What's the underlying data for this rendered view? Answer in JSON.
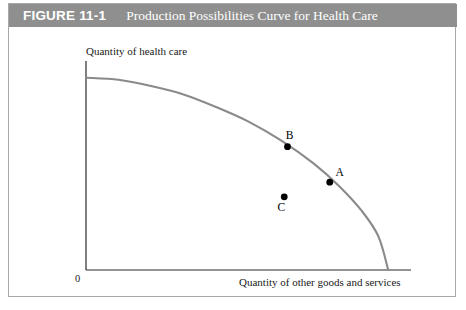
{
  "figure": {
    "number": "FIGURE 11-1",
    "title": "Production Possibilities Curve for Health Care"
  },
  "colors": {
    "header_background": "#8f8f8f",
    "header_text": "#ffffff",
    "border": "#a8a8a8",
    "curve": "#8a8a8a",
    "axis": "#2b2b2b",
    "point": "#000000",
    "plot_background": "#ffffff"
  },
  "chart_data": {
    "type": "line",
    "title": "Production Possibilities Curve for Health Care",
    "xlabel": "Quantity of other goods and services",
    "ylabel": "Quantity of health care",
    "origin_label": "0",
    "grid": false,
    "legend": null,
    "xlim": [
      0,
      100
    ],
    "ylim": [
      0,
      100
    ],
    "curve_name": "Production possibilities frontier",
    "curve_points": [
      {
        "x": 0,
        "y": 92
      },
      {
        "x": 10,
        "y": 91
      },
      {
        "x": 20,
        "y": 88
      },
      {
        "x": 30,
        "y": 84
      },
      {
        "x": 40,
        "y": 78
      },
      {
        "x": 50,
        "y": 71
      },
      {
        "x": 60,
        "y": 62
      },
      {
        "x": 70,
        "y": 51
      },
      {
        "x": 78,
        "y": 40
      },
      {
        "x": 85,
        "y": 28
      },
      {
        "x": 90,
        "y": 16
      },
      {
        "x": 93,
        "y": 0
      }
    ],
    "annotations": [
      {
        "label": "B",
        "x": 62,
        "y": 59,
        "on_curve": true,
        "label_position": "above-left"
      },
      {
        "label": "A",
        "x": 75,
        "y": 42,
        "on_curve": true,
        "label_position": "above-right"
      },
      {
        "label": "C",
        "x": 61,
        "y": 35,
        "on_curve": false,
        "label_position": "below"
      }
    ]
  }
}
